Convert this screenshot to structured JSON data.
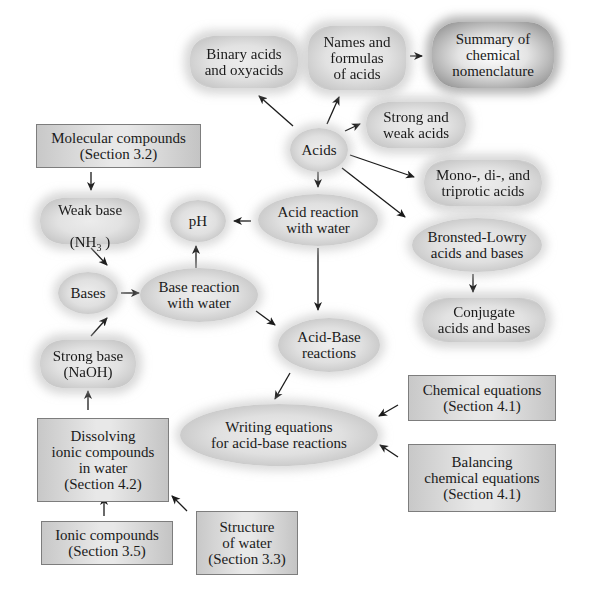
{
  "diagram": {
    "type": "concept-map",
    "topic": "Acids and bases",
    "nodes": {
      "binary_acids": "Binary acids\nand oxyacids",
      "names_formulas": "Names and\nformulas\nof acids",
      "summary_nomenclature": "Summary of\nchemical\nnomenclature",
      "strong_weak_acids": "Strong and\nweak acids",
      "acids": "Acids",
      "mono_di_tri": "Mono-, di-, and\ntriprotic acids",
      "molecular_compounds": "Molecular compounds\n(Section 3.2)",
      "weak_base_label": "Weak base",
      "weak_base_formula_pre": "(NH",
      "weak_base_formula_sub": "3",
      "weak_base_formula_post": " )",
      "ph": "pH",
      "acid_reaction_water": "Acid reaction\nwith water",
      "bronsted_lowry": "Bronsted-Lowry\nacids and bases",
      "bases": "Bases",
      "base_reaction_water": "Base reaction\nwith water",
      "conjugate": "Conjugate\nacids and bases",
      "strong_base": "Strong base\n(NaOH)",
      "acid_base_reactions": "Acid-Base\nreactions",
      "chemical_equations": "Chemical equations\n(Section 4.1)",
      "dissolving_ionic": "Dissolving\nionic compounds\nin water\n(Section 4.2)",
      "writing_equations": "Writing equations\nfor acid-base reactions",
      "balancing_equations": "Balancing\nchemical equations\n(Section 4.1)",
      "ionic_compounds": "Ionic compounds\n(Section 3.5)",
      "structure_water": "Structure\nof water\n(Section 3.3)"
    },
    "edges": [
      {
        "from": "acids",
        "to": "binary_acids"
      },
      {
        "from": "acids",
        "to": "names_formulas"
      },
      {
        "from": "names_formulas",
        "to": "summary_nomenclature"
      },
      {
        "from": "acids",
        "to": "strong_weak_acids"
      },
      {
        "from": "acids",
        "to": "mono_di_tri"
      },
      {
        "from": "acids",
        "to": "bronsted_lowry"
      },
      {
        "from": "acids",
        "to": "acid_reaction_water"
      },
      {
        "from": "acid_reaction_water",
        "to": "ph"
      },
      {
        "from": "acid_reaction_water",
        "to": "acid_base_reactions"
      },
      {
        "from": "bronsted_lowry",
        "to": "conjugate"
      },
      {
        "from": "molecular_compounds",
        "to": "weak_base"
      },
      {
        "from": "weak_base",
        "to": "bases"
      },
      {
        "from": "bases",
        "to": "base_reaction_water"
      },
      {
        "from": "base_reaction_water",
        "to": "ph"
      },
      {
        "from": "base_reaction_water",
        "to": "acid_base_reactions"
      },
      {
        "from": "strong_base",
        "to": "bases"
      },
      {
        "from": "dissolving_ionic",
        "to": "strong_base"
      },
      {
        "from": "ionic_compounds",
        "to": "dissolving_ionic"
      },
      {
        "from": "structure_water",
        "to": "dissolving_ionic"
      },
      {
        "from": "acid_base_reactions",
        "to": "writing_equations"
      },
      {
        "from": "chemical_equations",
        "to": "writing_equations"
      },
      {
        "from": "balancing_equations",
        "to": "writing_equations"
      }
    ],
    "colors": {
      "background": "#ffffff",
      "node_fill": "#e2e2e2",
      "node_edge": "#c4c4c4",
      "box_border": "#7d7d7d",
      "arrow": "#1a1a1a"
    }
  }
}
